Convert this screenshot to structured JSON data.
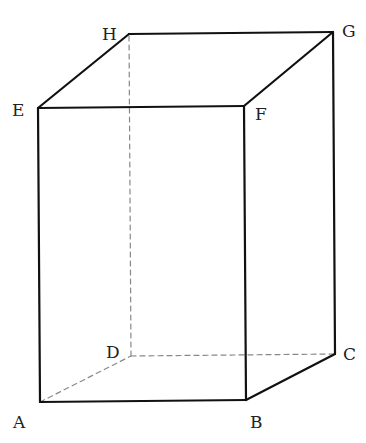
{
  "diagram": {
    "type": "rectangular-prism",
    "stroke_color": "#111111",
    "hidden_color": "#888888",
    "vertices": {
      "A": {
        "x": 40,
        "y": 402,
        "label": "A",
        "lx": 13,
        "ly": 428
      },
      "B": {
        "x": 246,
        "y": 400,
        "label": "B",
        "lx": 250,
        "ly": 428
      },
      "C": {
        "x": 335,
        "y": 354,
        "label": "C",
        "lx": 343,
        "ly": 360
      },
      "D": {
        "x": 131,
        "y": 356,
        "label": "D",
        "lx": 106,
        "ly": 358
      },
      "E": {
        "x": 38,
        "y": 108,
        "label": "E",
        "lx": 12,
        "ly": 116
      },
      "F": {
        "x": 244,
        "y": 106,
        "label": "F",
        "lx": 255,
        "ly": 120
      },
      "G": {
        "x": 333,
        "y": 32,
        "label": "G",
        "lx": 342,
        "ly": 37
      },
      "H": {
        "x": 129,
        "y": 34,
        "label": "H",
        "lx": 102,
        "ly": 40
      }
    },
    "visible_edges": [
      [
        "A",
        "B"
      ],
      [
        "B",
        "C"
      ],
      [
        "C",
        "G"
      ],
      [
        "G",
        "H"
      ],
      [
        "H",
        "E"
      ],
      [
        "E",
        "A"
      ],
      [
        "E",
        "F"
      ],
      [
        "F",
        "B"
      ],
      [
        "F",
        "G"
      ]
    ],
    "hidden_edges": [
      [
        "A",
        "D"
      ],
      [
        "D",
        "C"
      ],
      [
        "D",
        "H"
      ]
    ]
  }
}
